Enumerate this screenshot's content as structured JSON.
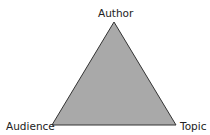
{
  "diagram": {
    "type": "triangle",
    "vertices": {
      "top": {
        "label": "Author"
      },
      "bottom_left": {
        "label": "Audience"
      },
      "bottom_right": {
        "label": "Topic"
      }
    },
    "colors": {
      "fill": "#a9a9a9",
      "stroke": "#333333",
      "text": "#222222"
    }
  }
}
